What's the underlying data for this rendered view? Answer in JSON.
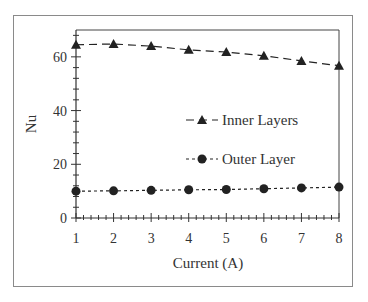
{
  "chart_data": {
    "type": "line",
    "title": "",
    "xlabel": "Current (A)",
    "ylabel": "Nu",
    "x": [
      1,
      2,
      3,
      4,
      5,
      6,
      7,
      8
    ],
    "xlim": [
      1,
      8
    ],
    "ylim": [
      0,
      70
    ],
    "xticks": [
      "1",
      "2",
      "3",
      "4",
      "5",
      "6",
      "7",
      "8"
    ],
    "yticks": [
      "0",
      "20",
      "40",
      "60"
    ],
    "grid": false,
    "legend_position": "center-right",
    "series": [
      {
        "name": "Inner Layers",
        "marker": "triangle",
        "linestyle": "long-dash",
        "values": [
          64.5,
          64.8,
          64.0,
          62.6,
          61.8,
          60.4,
          58.5,
          56.7
        ]
      },
      {
        "name": "Outer Layer",
        "marker": "circle",
        "linestyle": "short-dash",
        "values": [
          10.0,
          10.1,
          10.3,
          10.5,
          10.6,
          10.9,
          11.2,
          11.5
        ]
      }
    ]
  },
  "colors": {
    "line": "#222222",
    "frame": "#8a8a8a",
    "text": "#333333"
  }
}
